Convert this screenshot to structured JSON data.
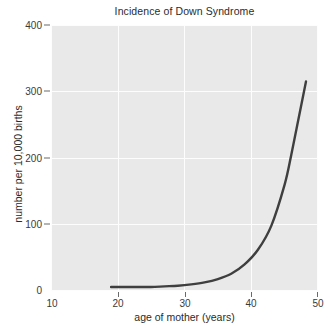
{
  "chart_data": {
    "type": "line",
    "title": "Incidence of Down Syndrome",
    "xlabel": "age of mother (years)",
    "ylabel": "number per 10,000 births",
    "xlim": [
      10,
      50
    ],
    "ylim": [
      0,
      400
    ],
    "xticks": [
      10,
      20,
      30,
      40,
      50
    ],
    "yticks": [
      0,
      100,
      200,
      300,
      400
    ],
    "xtick_labels": [
      "10",
      "20",
      "30",
      "40",
      "50"
    ],
    "ytick_labels": [
      "0",
      "100",
      "200",
      "300",
      "400"
    ],
    "grid": true,
    "grid_color": "#fdfdfd",
    "panel_color": "#e9e9e9",
    "legend": "none",
    "series": [
      {
        "name": "incidence",
        "color": "#3f3f3f",
        "line_width": 2.4,
        "x": [
          19,
          21,
          23,
          25,
          27,
          29,
          31,
          33,
          35,
          37,
          39,
          41,
          43,
          45,
          46,
          47,
          48.2
        ],
        "y": [
          6,
          6,
          6,
          6,
          7,
          8,
          10,
          13,
          18,
          26,
          40,
          62,
          98,
          160,
          205,
          255,
          315
        ]
      }
    ]
  }
}
